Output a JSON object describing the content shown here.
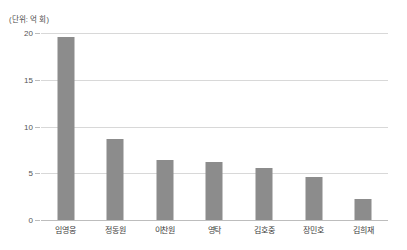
{
  "chart_data": {
    "type": "bar",
    "title": "",
    "subtitle": "",
    "unit_caption": "(단위: 억 회)",
    "categories": [
      "임영웅",
      "정동원",
      "이찬원",
      "영탁",
      "김호중",
      "장민호",
      "김희재"
    ],
    "values": [
      19.6,
      8.7,
      6.4,
      6.2,
      5.6,
      4.6,
      2.3
    ],
    "series": [
      {
        "name": "조회수",
        "values": [
          19.6,
          8.7,
          6.4,
          6.2,
          5.6,
          4.6,
          2.3
        ]
      }
    ],
    "xlabel": "",
    "ylabel": "",
    "ylim": [
      0,
      20
    ],
    "yticks": [
      0,
      5,
      10,
      15,
      20
    ],
    "ytick_labels": [
      "0",
      "5",
      "10",
      "15",
      "20"
    ],
    "grid": true,
    "legend": false,
    "legend_position": "none",
    "bar_color": "#8c8c8c",
    "gridline_color": "#d8d8d8",
    "axis_color": "#bdbdbd",
    "background_color": "#ffffff"
  }
}
